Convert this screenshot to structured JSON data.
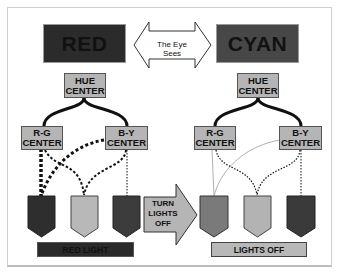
{
  "left_panel": {
    "color_box": {
      "label": "RED",
      "fill": "#2b2b2b"
    },
    "hue_center": {
      "line1": "HUE",
      "line2": "CENTER"
    },
    "rg_center": {
      "line1": "R-G",
      "line2": "CENTER"
    },
    "by_center": {
      "line1": "B-Y",
      "line2": "CENTER"
    },
    "cones": [
      {
        "name": "long",
        "fill": "#2e2e2e"
      },
      {
        "name": "medium",
        "fill": "#b8b8b8"
      },
      {
        "name": "short",
        "fill": "#3c3c3c"
      }
    ],
    "status_bar": {
      "label": "RED LIGHT",
      "fill": "#2a2a2a",
      "text_color": "#111111"
    }
  },
  "right_panel": {
    "color_box": {
      "label": "CYAN",
      "fill": "#474747"
    },
    "hue_center": {
      "line1": "HUE",
      "line2": "CENTER"
    },
    "rg_center": {
      "line1": "R-G",
      "line2": "CENTER"
    },
    "by_center": {
      "line1": "B-Y",
      "line2": "CENTER"
    },
    "cones": [
      {
        "name": "long",
        "fill": "#7a7a7a"
      },
      {
        "name": "medium",
        "fill": "#b3b3b3"
      },
      {
        "name": "short",
        "fill": "#3a3a3a"
      }
    ],
    "status_bar": {
      "label": "LIGHTS OFF",
      "fill": "#b8b8b8",
      "text_color": "#111111"
    }
  },
  "center": {
    "double_arrow_label": "The Eye Sees",
    "transition_arrow": {
      "line1": "TURN",
      "line2": "LIGHTS",
      "line3": "OFF"
    }
  }
}
